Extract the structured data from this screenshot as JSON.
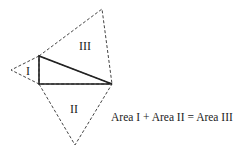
{
  "diagram": {
    "regions": [
      {
        "id": "square-1",
        "label": "I"
      },
      {
        "id": "square-2",
        "label": "II"
      },
      {
        "id": "square-3",
        "label": "III"
      }
    ],
    "caption": "Area I + Area II = Area III",
    "colors": {
      "stroke": "#222222",
      "dashed": "#444444",
      "background": "#ffffff"
    }
  }
}
